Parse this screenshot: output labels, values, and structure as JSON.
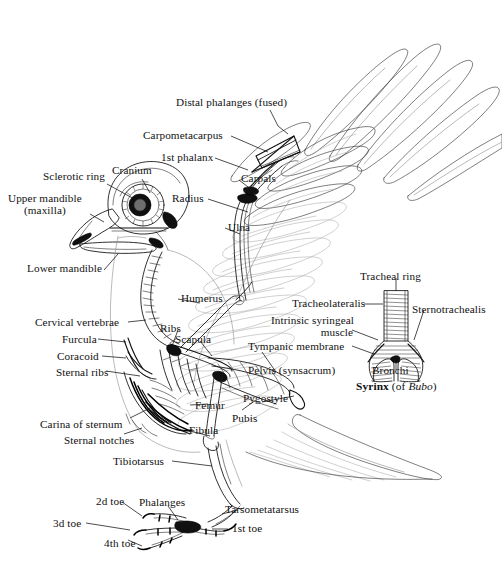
{
  "figure": {
    "background": "#ffffff",
    "ink_color": "#1a1a1a"
  },
  "inset": {
    "caption_bold": "Syrinx",
    "caption_rest": " (of ",
    "caption_italic": "Bubo",
    "caption_close": ")"
  },
  "labels": {
    "distal_phalanges": "Distal phalanges (fused)",
    "carpometacarpus": "Carpometacarpus",
    "first_phalanx": "1st phalanx",
    "sclerotic_ring": "Sclerotic ring",
    "cranium": "Cranium",
    "upper_mandible_l1": "Upper mandible",
    "upper_mandible_l2": "(maxilla)",
    "carpals": "Carpals",
    "radius": "Radius",
    "ulna": "Ulna",
    "lower_mandible": "Lower mandible",
    "humerus": "Humerus",
    "tracheal_ring": "Tracheal ring",
    "tracheolateralis": "Tracheolateralis",
    "sternotrachealis": "Sternotrachealis",
    "cervical_vertebrae": "Cervical vertebrae",
    "ribs": "Ribs",
    "scapula": "Scapula",
    "intrinsic_syringeal_l1": "Intrinsic syringeal",
    "intrinsic_syringeal_l2": "muscle",
    "furcula": "Furcula",
    "coracoid": "Coracoid",
    "tympanic_membrane": "Tympanic membrane",
    "sternal_ribs": "Sternal ribs",
    "pelvis": "Pelvis (synsacrum)",
    "bronchi": "Bronchi",
    "femur": "Femur",
    "pygostyle": "Pygostyle",
    "pubis": "Pubis",
    "carina_of_sternum": "Carina of sternum",
    "sternal_notches": "Sternal notches",
    "fibula": "Fibula",
    "tibiotarsus": "Tibiotarsus",
    "second_toe": "2d toe",
    "phalanges": "Phalanges",
    "tarsometatarsus": "Tarsometatarsus",
    "third_toe": "3d toe",
    "first_toe": "1st toe",
    "fourth_toe": "4th toe"
  }
}
